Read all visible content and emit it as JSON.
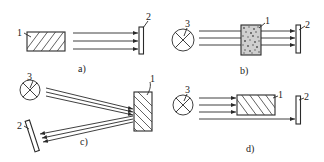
{
  "diagram": {
    "colors": {
      "line": "#2a2a2a",
      "background": "#ffffff"
    },
    "panels": [
      {
        "id": "a",
        "caption": "a)",
        "labels": {
          "object": "1",
          "detector": "2"
        },
        "components": [
          "hatched emitting object 1",
          "three parallel rays",
          "detector 2"
        ]
      },
      {
        "id": "b",
        "caption": "b)",
        "labels": {
          "source": "3",
          "object": "1",
          "detector": "2"
        },
        "components": [
          "lamp 3",
          "three parallel rays",
          "granular transmitting object 1",
          "detector 2"
        ]
      },
      {
        "id": "c",
        "caption": "c)",
        "labels": {
          "source": "3",
          "object": "1",
          "detector": "2"
        },
        "components": [
          "lamp 3",
          "rays incident on object",
          "hatched reflecting object 1",
          "reflected rays",
          "tilted detector 2"
        ]
      },
      {
        "id": "d",
        "caption": "d)",
        "labels": {
          "source": "3",
          "object": "1",
          "detector": "2"
        },
        "components": [
          "lamp 3",
          "three rays hitting object 1",
          "one ray passing under object",
          "hatched object 1",
          "detector 2"
        ]
      }
    ]
  }
}
